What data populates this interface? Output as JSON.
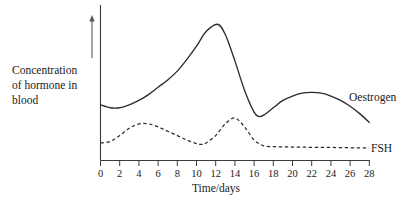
{
  "chart_data": {
    "type": "line",
    "title": "",
    "xlabel": "Time/days",
    "ylabel": "Concentration of hormone in blood",
    "ylabel_lines": [
      "Concentration",
      "of hormone in",
      "blood"
    ],
    "xlim": [
      0,
      28
    ],
    "ylim": [
      0,
      1
    ],
    "grid": false,
    "y_axis_ticks_shown": false,
    "y_axis_direction_arrow": "up",
    "legend_position": "inline-right-of-curve-end",
    "xticks": [
      0,
      2,
      4,
      6,
      8,
      10,
      12,
      14,
      16,
      18,
      20,
      22,
      24,
      26,
      28
    ],
    "xtick_labels": [
      "0",
      "2",
      "4",
      "6",
      "8",
      "10",
      "12",
      "14",
      "16",
      "18",
      "20",
      "22",
      "24",
      "26",
      "28"
    ],
    "series": [
      {
        "name": "Oestrogen",
        "style": "solid",
        "label": "Oestrogen",
        "x": [
          0,
          1,
          2,
          3,
          4,
          5,
          6,
          7,
          8,
          9,
          10,
          11,
          12.2,
          13,
          14,
          15,
          16,
          16.5,
          17,
          18,
          19,
          20,
          21,
          22,
          23,
          24,
          25,
          26,
          27,
          28
        ],
        "y": [
          0.38,
          0.36,
          0.36,
          0.38,
          0.41,
          0.45,
          0.5,
          0.55,
          0.61,
          0.69,
          0.78,
          0.88,
          0.93,
          0.86,
          0.68,
          0.48,
          0.33,
          0.3,
          0.31,
          0.36,
          0.41,
          0.44,
          0.46,
          0.465,
          0.46,
          0.44,
          0.41,
          0.37,
          0.32,
          0.26
        ]
      },
      {
        "name": "FSH",
        "style": "dashed",
        "label": "FSH",
        "x": [
          0,
          1,
          2,
          3,
          4,
          5,
          6,
          7,
          8,
          9,
          10,
          10.5,
          11,
          12,
          13,
          14,
          15,
          16,
          17,
          18,
          19,
          20,
          21,
          22,
          23,
          24,
          25,
          26,
          27,
          28
        ],
        "y": [
          0.12,
          0.13,
          0.17,
          0.22,
          0.25,
          0.25,
          0.23,
          0.2,
          0.17,
          0.14,
          0.115,
          0.11,
          0.12,
          0.17,
          0.25,
          0.29,
          0.23,
          0.14,
          0.1,
          0.095,
          0.093,
          0.092,
          0.091,
          0.09,
          0.09,
          0.089,
          0.088,
          0.087,
          0.086,
          0.085
        ]
      }
    ]
  },
  "axes": {
    "x_axis_name": "time-axis",
    "y_axis_name": "concentration-axis"
  }
}
